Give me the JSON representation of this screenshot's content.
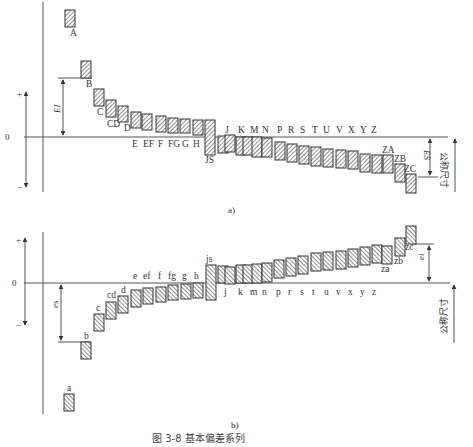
{
  "figure": {
    "caption": "图 3-8   基本偏差系列",
    "sub_a": "a)",
    "sub_b": "b)"
  },
  "upper": {
    "zero_label": "0",
    "plus_label": "+",
    "minus_label": "−",
    "dim_EI": "EI",
    "dim_ES": "ES",
    "nominal_label": "公称尺寸",
    "zero_y": 137,
    "bars": [
      {
        "label": "A",
        "x": 65,
        "y1": 10,
        "y2": 27,
        "lx": 70,
        "ly": 36
      },
      {
        "label": "B",
        "x": 81,
        "y1": 61,
        "y2": 78,
        "lx": 86,
        "ly": 87
      },
      {
        "label": "C",
        "x": 94,
        "y1": 89,
        "y2": 106,
        "lx": 97,
        "ly": 115
      },
      {
        "label": "CD",
        "x": 106,
        "y1": 100,
        "y2": 117,
        "lx": 107,
        "ly": 127
      },
      {
        "label": "D",
        "x": 118,
        "y1": 106,
        "y2": 122,
        "lx": 124,
        "ly": 131
      },
      {
        "label": "E",
        "x": 131,
        "y1": 112,
        "y2": 128,
        "lx": 132,
        "ly": 147
      },
      {
        "label": "EF",
        "x": 142,
        "y1": 114,
        "y2": 130,
        "lx": 143,
        "ly": 147
      },
      {
        "label": "F",
        "x": 156,
        "y1": 116,
        "y2": 132,
        "lx": 158,
        "ly": 147
      },
      {
        "label": "FG",
        "x": 168,
        "y1": 118,
        "y2": 133,
        "lx": 168,
        "ly": 147
      },
      {
        "label": "G",
        "x": 180,
        "y1": 119,
        "y2": 133,
        "lx": 182,
        "ly": 147
      },
      {
        "label": "H",
        "x": 193,
        "y1": 120,
        "y2": 135,
        "lx": 193,
        "ly": 147
      },
      {
        "label": "JS",
        "x": 205,
        "y1": 120,
        "y2": 155,
        "lx": 205,
        "ly": 163
      },
      {
        "label": "J",
        "x": 218,
        "y1": 136,
        "y2": 153,
        "lx": 225,
        "ly": 133
      },
      {
        "label": "",
        "x": 225,
        "y1": 135,
        "y2": 152,
        "lx": 0,
        "ly": 0
      },
      {
        "label": "K",
        "x": 236,
        "y1": 137,
        "y2": 155,
        "lx": 238,
        "ly": 133
      },
      {
        "label": "",
        "x": 243,
        "y1": 137,
        "y2": 155,
        "lx": 0,
        "ly": 0
      },
      {
        "label": "M",
        "x": 252,
        "y1": 137,
        "y2": 157,
        "lx": 250,
        "ly": 133
      },
      {
        "label": "N",
        "x": 262,
        "y1": 138,
        "y2": 157,
        "lx": 262,
        "ly": 133
      },
      {
        "label": "P",
        "x": 275,
        "y1": 142,
        "y2": 160,
        "lx": 277,
        "ly": 133
      },
      {
        "label": "R",
        "x": 287,
        "y1": 144,
        "y2": 162,
        "lx": 288,
        "ly": 133
      },
      {
        "label": "S",
        "x": 299,
        "y1": 146,
        "y2": 164,
        "lx": 300,
        "ly": 133
      },
      {
        "label": "T",
        "x": 311,
        "y1": 147,
        "y2": 166,
        "lx": 312,
        "ly": 133
      },
      {
        "label": "U",
        "x": 323,
        "y1": 149,
        "y2": 167,
        "lx": 323,
        "ly": 133
      },
      {
        "label": "V",
        "x": 336,
        "y1": 150,
        "y2": 168,
        "lx": 336,
        "ly": 133
      },
      {
        "label": "X",
        "x": 348,
        "y1": 151,
        "y2": 169,
        "lx": 348,
        "ly": 133
      },
      {
        "label": "Y",
        "x": 360,
        "y1": 154,
        "y2": 172,
        "lx": 360,
        "ly": 133
      },
      {
        "label": "Z",
        "x": 372,
        "y1": 155,
        "y2": 173,
        "lx": 371,
        "ly": 133
      },
      {
        "label": "ZA",
        "x": 383,
        "y1": 155,
        "y2": 173,
        "lx": 382,
        "ly": 153
      },
      {
        "label": "ZB",
        "x": 395,
        "y1": 164,
        "y2": 182,
        "lx": 394,
        "ly": 162
      },
      {
        "label": "ZC",
        "x": 406,
        "y1": 174,
        "y2": 193,
        "lx": 404,
        "ly": 172
      }
    ]
  },
  "lower": {
    "zero_label": "0",
    "plus_label": "+",
    "minus_label": "−",
    "dim_es": "es",
    "dim_ei": "ei",
    "nominal_label": "公称尺寸",
    "zero_y": 283,
    "bars": [
      {
        "label": "a",
        "x": 64,
        "y1": 394,
        "y2": 411,
        "lx": 67,
        "ly": 391
      },
      {
        "label": "b",
        "x": 81,
        "y1": 342,
        "y2": 359,
        "lx": 84,
        "ly": 339
      },
      {
        "label": "c",
        "x": 94,
        "y1": 314,
        "y2": 331,
        "lx": 96,
        "ly": 311
      },
      {
        "label": "cd",
        "x": 106,
        "y1": 302,
        "y2": 319,
        "lx": 107,
        "ly": 298
      },
      {
        "label": "d",
        "x": 118,
        "y1": 296,
        "y2": 313,
        "lx": 121,
        "ly": 293
      },
      {
        "label": "e",
        "x": 131,
        "y1": 290,
        "y2": 307,
        "lx": 133,
        "ly": 279
      },
      {
        "label": "ef",
        "x": 143,
        "y1": 288,
        "y2": 304,
        "lx": 143,
        "ly": 279
      },
      {
        "label": "f",
        "x": 156,
        "y1": 287,
        "y2": 302,
        "lx": 158,
        "ly": 279
      },
      {
        "label": "fg",
        "x": 168,
        "y1": 285,
        "y2": 300,
        "lx": 168,
        "ly": 279
      },
      {
        "label": "g",
        "x": 181,
        "y1": 284,
        "y2": 299,
        "lx": 182,
        "ly": 279
      },
      {
        "label": "h",
        "x": 193,
        "y1": 283,
        "y2": 298,
        "lx": 194,
        "ly": 279
      },
      {
        "label": "js",
        "x": 206,
        "y1": 265,
        "y2": 300,
        "lx": 206,
        "ly": 262
      },
      {
        "label": "j",
        "x": 218,
        "y1": 266,
        "y2": 283,
        "lx": 224,
        "ly": 295
      },
      {
        "label": "",
        "x": 225,
        "y1": 267,
        "y2": 284,
        "lx": 0,
        "ly": 0
      },
      {
        "label": "k",
        "x": 236,
        "y1": 265,
        "y2": 283,
        "lx": 238,
        "ly": 295
      },
      {
        "label": "",
        "x": 243,
        "y1": 265,
        "y2": 283,
        "lx": 0,
        "ly": 0
      },
      {
        "label": "m",
        "x": 252,
        "y1": 264,
        "y2": 283,
        "lx": 250,
        "ly": 295
      },
      {
        "label": "n",
        "x": 262,
        "y1": 263,
        "y2": 282,
        "lx": 262,
        "ly": 295
      },
      {
        "label": "p",
        "x": 274,
        "y1": 260,
        "y2": 278,
        "lx": 276,
        "ly": 295
      },
      {
        "label": "r",
        "x": 286,
        "y1": 258,
        "y2": 276,
        "lx": 288,
        "ly": 295
      },
      {
        "label": "s",
        "x": 298,
        "y1": 256,
        "y2": 274,
        "lx": 300,
        "ly": 295
      },
      {
        "label": "t",
        "x": 311,
        "y1": 253,
        "y2": 271,
        "lx": 312,
        "ly": 295
      },
      {
        "label": "u",
        "x": 323,
        "y1": 252,
        "y2": 270,
        "lx": 324,
        "ly": 295
      },
      {
        "label": "v",
        "x": 336,
        "y1": 251,
        "y2": 269,
        "lx": 336,
        "ly": 295
      },
      {
        "label": "x",
        "x": 348,
        "y1": 249,
        "y2": 267,
        "lx": 348,
        "ly": 295
      },
      {
        "label": "y",
        "x": 360,
        "y1": 247,
        "y2": 265,
        "lx": 360,
        "ly": 295
      },
      {
        "label": "z",
        "x": 372,
        "y1": 245,
        "y2": 263,
        "lx": 372,
        "ly": 295
      },
      {
        "label": "za",
        "x": 382,
        "y1": 246,
        "y2": 264,
        "lx": 381,
        "ly": 272
      },
      {
        "label": "zb",
        "x": 395,
        "y1": 238,
        "y2": 256,
        "lx": 394,
        "ly": 264
      },
      {
        "label": "zc",
        "x": 406,
        "y1": 226,
        "y2": 244,
        "lx": 405,
        "ly": 250
      }
    ]
  }
}
